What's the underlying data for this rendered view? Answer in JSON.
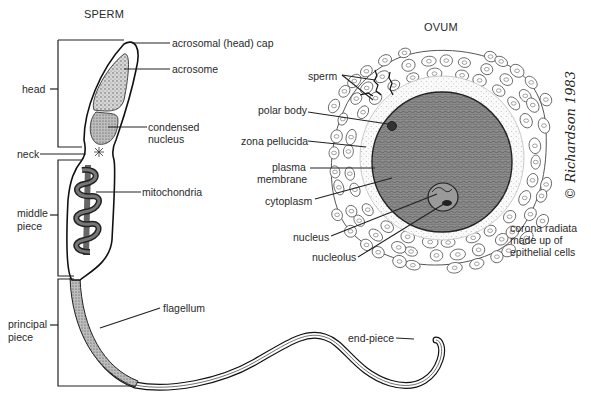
{
  "diagram": {
    "sperm": {
      "title": "SPERM",
      "section_labels": {
        "head": "head",
        "neck": "neck",
        "middle_piece": [
          "middle",
          "piece"
        ],
        "principal_piece": [
          "principal",
          "piece"
        ]
      },
      "part_labels": {
        "acrosomal_cap": "acrosomal (head) cap",
        "acrosome": "acrosome",
        "condensed_nucleus": [
          "condensed",
          "nucleus"
        ],
        "mitochondria": "mitochondria",
        "flagellum": "flagellum",
        "end_piece": "end-piece"
      }
    },
    "ovum": {
      "title": "OVUM",
      "labels": {
        "sperm": "sperm",
        "polar_body": "polar body",
        "zona_pellucida": "zona pellucida",
        "plasma_membrane": [
          "plasma",
          "membrane"
        ],
        "cytoplasm": "cytoplasm",
        "nucleus": "nucleus",
        "nucleolus": "nucleolus",
        "corona_radiata": [
          "corona radiata",
          "made up of",
          "epithelial cells"
        ]
      }
    },
    "signature": "© Richardson 1983",
    "colors": {
      "ink": "#222222",
      "cytoplasm": "#8a8a8a",
      "background": "#ffffff"
    }
  }
}
